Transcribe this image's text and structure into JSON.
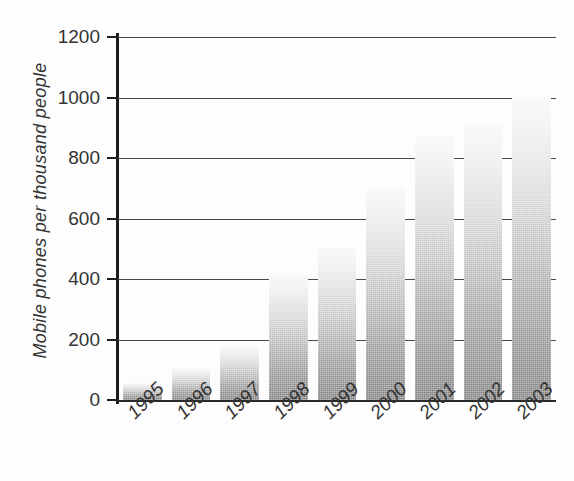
{
  "chart_data": {
    "type": "bar",
    "title": "",
    "subtitle": "",
    "xlabel": "",
    "ylabel": "Mobile phones per thousand people",
    "categories": [
      "1995",
      "1996",
      "1997",
      "1998",
      "1999",
      "2000",
      "2001",
      "2002",
      "2003"
    ],
    "values": [
      56,
      106,
      178,
      413,
      506,
      700,
      876,
      909,
      1000
    ],
    "ylim": [
      0,
      1200
    ],
    "ytick_labels": [
      "0",
      "200",
      "400",
      "600",
      "800",
      "1000",
      "1200"
    ],
    "ytick_values": [
      0,
      200,
      400,
      600,
      800,
      1000,
      1200
    ],
    "grid": "horizontal",
    "legend": "none",
    "bar_style": "vertical-gradient-light-top-dark-bottom",
    "bar_color_top": "#f7f7f7",
    "bar_color_bottom": "#7e7e7e",
    "axis_color": "#1d1d1d",
    "text_color": "#333333",
    "background_color": "#fdfdfd"
  },
  "axes": {
    "y_title": "Mobile phones per thousand people"
  }
}
